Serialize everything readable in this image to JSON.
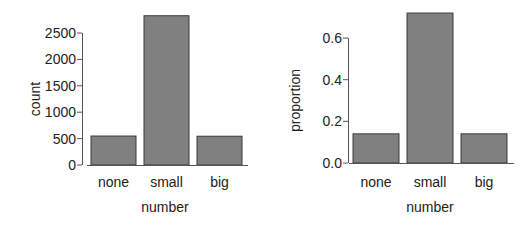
{
  "chart_data": [
    {
      "type": "bar",
      "title": "",
      "categories": [
        "none",
        "small",
        "big"
      ],
      "values": [
        549,
        2827,
        545
      ],
      "xlabel": "number",
      "ylabel": "count",
      "ylim": [
        0,
        2900
      ],
      "yticks": [
        0,
        500,
        1000,
        1500,
        2000,
        2500
      ],
      "grid": false,
      "bar_color": "#808080"
    },
    {
      "type": "bar",
      "title": "",
      "categories": [
        "none",
        "small",
        "big"
      ],
      "values": [
        0.14,
        0.72,
        0.14
      ],
      "xlabel": "number",
      "ylabel": "proportion",
      "ylim": [
        0,
        0.73
      ],
      "yticks": [
        "0.0",
        "0.2",
        "0.4",
        "0.6"
      ],
      "grid": false,
      "bar_color": "#808080"
    }
  ]
}
